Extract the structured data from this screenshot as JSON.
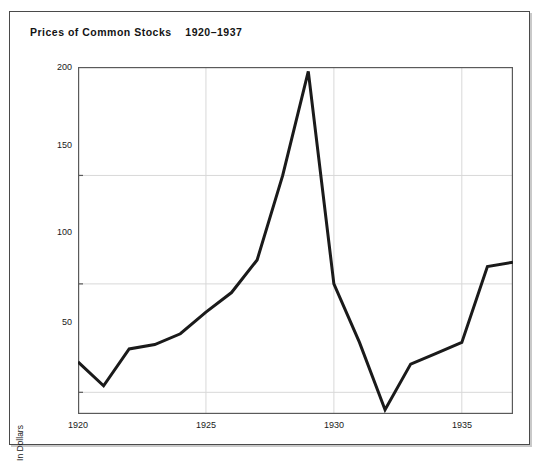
{
  "figure": {
    "title": "Prices of Common Stocks    1920–1937",
    "title_main": "Prices of Common Stocks",
    "title_years": "1920–1937",
    "frame_color": "#4a4a4a",
    "background": "#ffffff"
  },
  "chart_data": {
    "type": "line",
    "title": "Prices of Common Stocks    1920–1937",
    "xlabel": "",
    "ylabel": "In Dollars",
    "x": [
      1920,
      1921,
      1922,
      1923,
      1924,
      1925,
      1926,
      1927,
      1928,
      1929,
      1930,
      1931,
      1932,
      1933,
      1934,
      1935,
      1936,
      1937
    ],
    "values": [
      64,
      53,
      70,
      72,
      77,
      87,
      96,
      111,
      150,
      198,
      100,
      73,
      42,
      63,
      68,
      73,
      108,
      110
    ],
    "series": [
      {
        "name": "Common Stock Price Index",
        "values": [
          64,
          53,
          70,
          72,
          77,
          87,
          96,
          111,
          150,
          198,
          100,
          73,
          42,
          63,
          68,
          73,
          108,
          110
        ]
      }
    ],
    "xlim": [
      1920,
      1937
    ],
    "ylim": [
      40,
      200
    ],
    "xticks": [
      1920,
      1925,
      1930,
      1935
    ],
    "xtick_labels": [
      "1920",
      "1925",
      "1930",
      "1935"
    ],
    "yticks": [
      50,
      100,
      150,
      200
    ],
    "ytick_labels": [
      "50",
      "100",
      "150",
      "200"
    ],
    "grid": true,
    "grid_color": "#d8d8d8",
    "line_color": "#1a1a1a",
    "line_width": 3,
    "legend": false,
    "legend_position": "none"
  },
  "axis": {
    "y_label": "In Dollars",
    "y_ticks": [
      "200",
      "150",
      "100",
      "50"
    ],
    "x_ticks": [
      "1920",
      "1925",
      "1930",
      "1935"
    ]
  }
}
